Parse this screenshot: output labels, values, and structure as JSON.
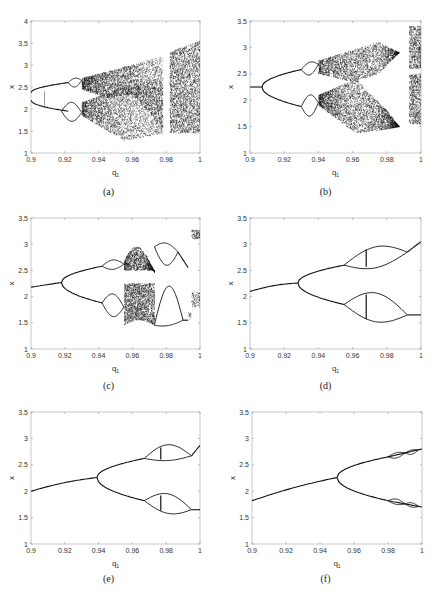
{
  "figure": {
    "panels": [
      {
        "id": "a",
        "caption": "(a)",
        "xlabel": "q",
        "xlabel_sub": "1",
        "ylabel": "x",
        "ylim": [
          1,
          4
        ],
        "yticks": [
          "1",
          "1.5",
          "2",
          "2.5",
          "3",
          "3.5",
          "4"
        ],
        "xlim": [
          0.9,
          1.0
        ],
        "xticks": [
          "0.9",
          "0.92",
          "0.94",
          "0.96",
          "0.98",
          "1"
        ]
      },
      {
        "id": "b",
        "caption": "(b)",
        "xlabel": "q",
        "xlabel_sub": "1",
        "ylabel": "x",
        "ylim": [
          1,
          3.5
        ],
        "yticks": [
          "1",
          "1.5",
          "2",
          "2.5",
          "3",
          "3.5"
        ],
        "xlim": [
          0.9,
          1.0
        ],
        "xticks": [
          "0.9",
          "0.92",
          "0.94",
          "0.96",
          "0.98",
          "1"
        ]
      },
      {
        "id": "c",
        "caption": "(c)",
        "xlabel": "q",
        "xlabel_sub": "1",
        "ylabel": "x",
        "ylim": [
          1,
          3.5
        ],
        "yticks": [
          "1",
          "1.5",
          "2",
          "2.5",
          "3",
          "3.5"
        ],
        "xlim": [
          0.9,
          1.0
        ],
        "xticks": [
          "0.9",
          "0.92",
          "0.94",
          "0.96",
          "0.98",
          "1"
        ]
      },
      {
        "id": "d",
        "caption": "(d)",
        "xlabel": "q",
        "xlabel_sub": "1",
        "ylabel": "x",
        "ylim": [
          1,
          3.5
        ],
        "yticks": [
          "1",
          "1.5",
          "2",
          "2.5",
          "3",
          "3.5"
        ],
        "xlim": [
          0.9,
          1.0
        ],
        "xticks": [
          "0.9",
          "0.92",
          "0.94",
          "0.96",
          "0.98",
          "1"
        ]
      },
      {
        "id": "e",
        "caption": "(e)",
        "xlabel": "q",
        "xlabel_sub": "1",
        "ylabel": "x",
        "ylim": [
          1,
          3.5
        ],
        "yticks": [
          "1",
          "1.5",
          "2",
          "2.5",
          "3",
          "3.5"
        ],
        "xlim": [
          0.9,
          1.0
        ],
        "xticks": [
          "0.9",
          "0.92",
          "0.94",
          "0.96",
          "0.98",
          "1"
        ]
      },
      {
        "id": "f",
        "caption": "(f)",
        "xlabel": "q",
        "xlabel_sub": "1",
        "ylabel": "x",
        "ylim": [
          1,
          3.5
        ],
        "yticks": [
          "1",
          "1.5",
          "2",
          "2.5",
          "3",
          "3.5"
        ],
        "xlim": [
          0.9,
          1.0
        ],
        "xticks": [
          "0.9",
          "0.92",
          "0.94",
          "0.96",
          "0.98",
          "1"
        ]
      }
    ]
  },
  "chart_data": [
    {
      "panel": "a",
      "type": "scatter",
      "title": "(a)",
      "xlabel": "q1",
      "ylabel": "x",
      "xlim": [
        0.9,
        1.0
      ],
      "ylim": [
        1,
        4
      ],
      "grid": false,
      "bifurcation": {
        "period1_start": {
          "x": 0.9,
          "y_upper": 2.37,
          "y_lower": 2.2
        },
        "period2_branches": [
          {
            "x": [
              0.9,
              0.922
            ],
            "y": [
              2.37,
              2.6
            ]
          },
          {
            "x": [
              0.9,
              0.922
            ],
            "y": [
              2.2,
              1.95
            ]
          }
        ],
        "period4_at": 0.922,
        "chaos_onset": 0.93,
        "chaotic_band_upper": {
          "x": [
            0.93,
            0.96,
            0.975,
            1.0
          ],
          "ymin": [
            2.4,
            2.25,
            2.4,
            1.5
          ],
          "ymax": [
            2.7,
            3.0,
            3.2,
            3.55
          ]
        },
        "chaotic_band_lower": {
          "x": [
            0.93,
            0.955,
            0.975
          ],
          "ymin": [
            1.8,
            1.28,
            1.45
          ],
          "ymax": [
            2.1,
            2.5,
            2.6
          ]
        },
        "window_near": 0.98
      }
    },
    {
      "panel": "b",
      "type": "scatter",
      "title": "(b)",
      "xlabel": "q1",
      "ylabel": "x",
      "xlim": [
        0.9,
        1.0
      ],
      "ylim": [
        1,
        3.5
      ],
      "grid": false,
      "bifurcation": {
        "period1": {
          "x": [
            0.9,
            0.907
          ],
          "y": [
            2.25,
            2.25
          ]
        },
        "period2_at": 0.907,
        "period4_at": 0.93,
        "chaos_onset": 0.94,
        "chaotic_band_upper": {
          "x": [
            0.94,
            0.96,
            0.975,
            0.987
          ],
          "ymin": [
            2.5,
            2.35,
            2.5,
            2.9
          ],
          "ymax": [
            2.75,
            2.95,
            3.1,
            2.9
          ]
        },
        "chaotic_band_lower": {
          "x": [
            0.94,
            0.962,
            0.98,
            0.987
          ],
          "ymin": [
            1.9,
            1.37,
            1.45,
            1.5
          ],
          "ymax": [
            2.1,
            2.4,
            1.8,
            1.5
          ]
        },
        "window_gap": [
          0.988,
          0.993
        ],
        "chaos_return": {
          "x": [
            0.993,
            1.0
          ],
          "ymin": 1.55,
          "ymax": 3.4
        }
      }
    },
    {
      "panel": "c",
      "type": "scatter",
      "title": "(c)",
      "xlabel": "q1",
      "ylabel": "x",
      "xlim": [
        0.9,
        1.0
      ],
      "ylim": [
        1,
        3.5
      ],
      "grid": false,
      "bifurcation": {
        "period1": {
          "x": [
            0.9,
            0.918
          ],
          "y": [
            2.18,
            2.27
          ]
        },
        "period2_at": 0.918,
        "period4_at": 0.942,
        "chaos_band": [
          0.955,
          0.973
        ],
        "upper_chaos": {
          "ymin": 2.5,
          "ymax": 2.95
        },
        "lower_chaos": {
          "ymin": 1.45,
          "ymax": 2.25
        },
        "period_halving_after": 0.975,
        "end_values": {
          "x": 1.0,
          "y": [
            3.25,
            2.05,
            1.8
          ]
        }
      }
    },
    {
      "panel": "d",
      "type": "line",
      "title": "(d)",
      "xlabel": "q1",
      "ylabel": "x",
      "xlim": [
        0.9,
        1.0
      ],
      "ylim": [
        1,
        3.5
      ],
      "grid": false,
      "bifurcation": {
        "period1": {
          "x": [
            0.9,
            0.928
          ],
          "y": [
            2.1,
            2.26
          ]
        },
        "period2_at": 0.928,
        "period4_at": 0.955,
        "upper_branch_at_955": 2.6,
        "lower_branch_at_955": 1.85,
        "bubble_upper": {
          "x": [
            0.955,
            0.992
          ],
          "ymin": 2.55,
          "ymax": 2.95
        },
        "bubble_lower": {
          "x": [
            0.955,
            0.992
          ],
          "ymin": 1.52,
          "ymax": 2.07
        },
        "merge_at": 0.992,
        "end_values": {
          "x": 1.0,
          "y": [
            3.05,
            1.65
          ]
        }
      }
    },
    {
      "panel": "e",
      "type": "line",
      "title": "(e)",
      "xlabel": "q1",
      "ylabel": "x",
      "xlim": [
        0.9,
        1.0
      ],
      "ylim": [
        1,
        3.5
      ],
      "grid": false,
      "bifurcation": {
        "period1": {
          "x": [
            0.9,
            0.939
          ],
          "y": [
            2.0,
            2.26
          ]
        },
        "period2_at": 0.939,
        "period4_at": 0.967,
        "upper_branch_at_967": 2.62,
        "lower_branch_at_967": 1.82,
        "bubble_upper": {
          "x": [
            0.967,
            0.995
          ],
          "ymin": 2.58,
          "ymax": 2.88
        },
        "bubble_lower": {
          "x": [
            0.967,
            0.995
          ],
          "ymin": 1.58,
          "ymax": 1.95
        },
        "merge_at": 0.995,
        "end_values": {
          "x": 1.0,
          "y": [
            2.87,
            1.65
          ]
        }
      }
    },
    {
      "panel": "f",
      "type": "line",
      "title": "(f)",
      "xlabel": "q1",
      "ylabel": "x",
      "xlim": [
        0.9,
        1.0
      ],
      "ylim": [
        1,
        3.5
      ],
      "grid": false,
      "bifurcation": {
        "period1": {
          "x": [
            0.9,
            0.95
          ],
          "y": [
            1.82,
            2.26
          ]
        },
        "period2_at": 0.95,
        "period4_at": 0.98,
        "upper_branch_at_980": 2.65,
        "lower_branch_at_980": 1.82,
        "bubbles_upper": [
          {
            "x": [
              0.98,
              0.99
            ],
            "ymin": 2.63,
            "ymax": 2.73
          },
          {
            "x": [
              0.99,
              0.998
            ],
            "ymin": 2.7,
            "ymax": 2.78
          }
        ],
        "bubbles_lower": [
          {
            "x": [
              0.98,
              0.99
            ],
            "ymin": 1.75,
            "ymax": 1.85
          },
          {
            "x": [
              0.99,
              0.998
            ],
            "ymin": 1.7,
            "ymax": 1.78
          }
        ],
        "end_values": {
          "x": 1.0,
          "y": [
            2.8,
            1.7
          ]
        }
      }
    }
  ]
}
